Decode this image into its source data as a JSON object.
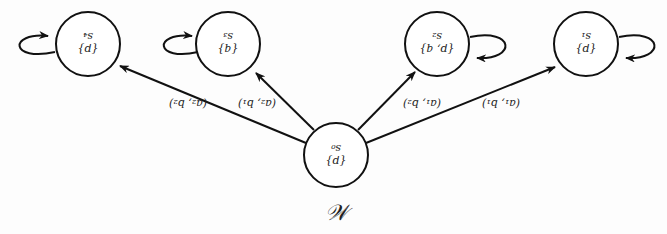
{
  "diagram": {
    "title": "𝒲",
    "colors": {
      "stroke": "#111111",
      "background": "#fdfdfd",
      "text": "#222222"
    },
    "orientation": "text rotated 180°",
    "nodes": [
      {
        "id": "s0",
        "name": "s₀",
        "props": "{p}",
        "cx": 336,
        "cy": 155
      },
      {
        "id": "s1",
        "name": "s₁",
        "props": "{p}",
        "cx": 586,
        "cy": 44
      },
      {
        "id": "s2",
        "name": "s₂",
        "props": "{p, q}",
        "cx": 437,
        "cy": 44
      },
      {
        "id": "s3",
        "name": "s₃",
        "props": "{q}",
        "cx": 228,
        "cy": 44
      },
      {
        "id": "s4",
        "name": "s₄",
        "props": "{p}",
        "cx": 88,
        "cy": 44
      }
    ],
    "edges": [
      {
        "from": "s0",
        "to": "s1",
        "label": "(a₁, b₁)"
      },
      {
        "from": "s0",
        "to": "s2",
        "label": "(a₁, b₂)"
      },
      {
        "from": "s0",
        "to": "s3",
        "label": "(a₂, b₁)"
      },
      {
        "from": "s0",
        "to": "s4",
        "label": "(a₂, b₂)"
      }
    ],
    "self_loops": [
      "s1",
      "s2",
      "s3",
      "s4"
    ]
  }
}
